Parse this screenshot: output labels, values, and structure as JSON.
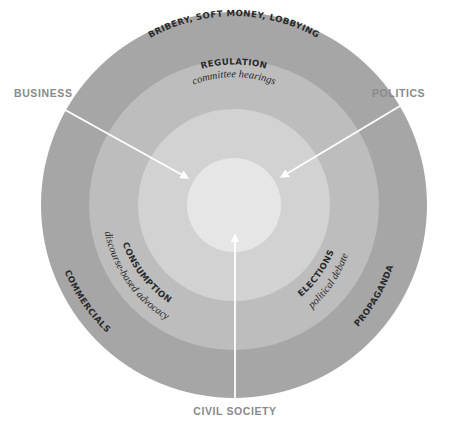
{
  "diagram": {
    "type": "concentric-rings",
    "center": {
      "x": 234,
      "y": 205
    },
    "rings": [
      {
        "name": "outer",
        "radius": 193,
        "color": "#a6a6a6"
      },
      {
        "name": "middle",
        "radius": 145,
        "color": "#bdbdbd"
      },
      {
        "name": "inner",
        "radius": 96,
        "color": "#d2d2d2"
      },
      {
        "name": "core",
        "radius": 47,
        "color": "#e6e6e6"
      }
    ],
    "external_labels": {
      "business": "BUSINESS",
      "politics": "POLITICS",
      "civil_society": "CIVIL SOCIETY"
    },
    "outer_ring_labels": {
      "top": "BRIBERY, SOFT MONEY, LOBBYING",
      "left": "COMMERCIALS",
      "right": "PROPAGANDA"
    },
    "middle_ring_labels": {
      "top_title": "REGULATION",
      "top_sub": "committee hearings",
      "left_title": "CONSUMPTION",
      "left_sub": "discourse-based advocacy",
      "right_title": "ELECTIONS",
      "right_sub": "political debate"
    },
    "arrow_color": "#ffffff",
    "label_color": "#8a8a8a",
    "text_color": "#2a2a2a"
  }
}
